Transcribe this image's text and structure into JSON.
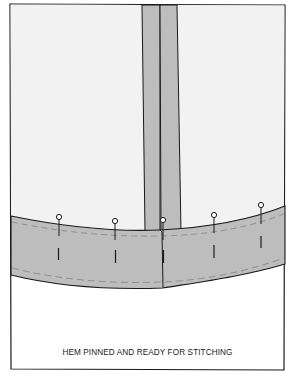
{
  "caption": "HEM PINNED AND READY FOR STITCHING",
  "colors": {
    "fabric": "#f2f2f2",
    "seam_allowance": "#bdbdbd",
    "hem_band": "#bdbdbd",
    "outline": "#1a1a1a",
    "stitch_line": "#8a8a8a",
    "background": "#ffffff"
  },
  "diagram": {
    "parts": [
      "garment-panel",
      "center-seam-allowance",
      "folded-hem-band",
      "basting-line",
      "stitch-guide-line"
    ],
    "pins": [
      {
        "id": 1,
        "x": 59,
        "head_y": 217
      },
      {
        "id": 2,
        "x": 115,
        "head_y": 221
      },
      {
        "id": 3,
        "x": 163,
        "head_y": 220
      },
      {
        "id": 4,
        "x": 214,
        "head_y": 215
      },
      {
        "id": 5,
        "x": 261,
        "head_y": 205
      }
    ]
  }
}
